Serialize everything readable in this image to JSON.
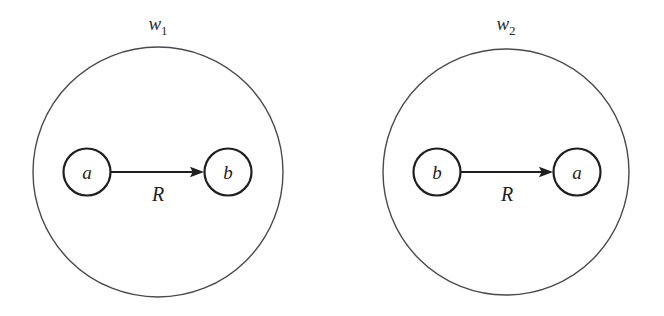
{
  "figure": {
    "caption": "",
    "background_color": "#ffffff",
    "line_color": "#1f1f1f",
    "world_stroke_color": "#4a4a4a"
  },
  "diagrams": [
    {
      "id": "world-1",
      "world_label_base": "w",
      "world_label_sub": "1",
      "world_label_full": "w1",
      "world_center_x": 158,
      "world_center_y": 172,
      "world_radius": 125,
      "world_label_x": 158,
      "world_label_y": 30,
      "source_node": {
        "label": "a",
        "cx": 87,
        "cy": 172,
        "r": 23.5
      },
      "target_node": {
        "label": "b",
        "cx": 228,
        "cy": 172,
        "r": 23.5
      },
      "edge": {
        "label": "R",
        "label_x": 158,
        "label_y": 199,
        "x1": 111,
        "y1": 172,
        "x2": 203,
        "y2": 172,
        "direction": "left-to-right"
      }
    },
    {
      "id": "world-2",
      "world_label_base": "w",
      "world_label_sub": "2",
      "world_label_full": "w2",
      "world_center_x": 506,
      "world_center_y": 172,
      "world_radius": 123,
      "world_label_x": 506,
      "world_label_y": 30,
      "source_node": {
        "label": "b",
        "cx": 437,
        "cy": 172,
        "r": 23.5
      },
      "target_node": {
        "label": "a",
        "cx": 577,
        "cy": 172,
        "r": 23.5
      },
      "edge": {
        "label": "R",
        "label_x": 507,
        "label_y": 199,
        "x1": 461,
        "y1": 172,
        "x2": 552,
        "y2": 172,
        "direction": "left-to-right"
      }
    }
  ]
}
